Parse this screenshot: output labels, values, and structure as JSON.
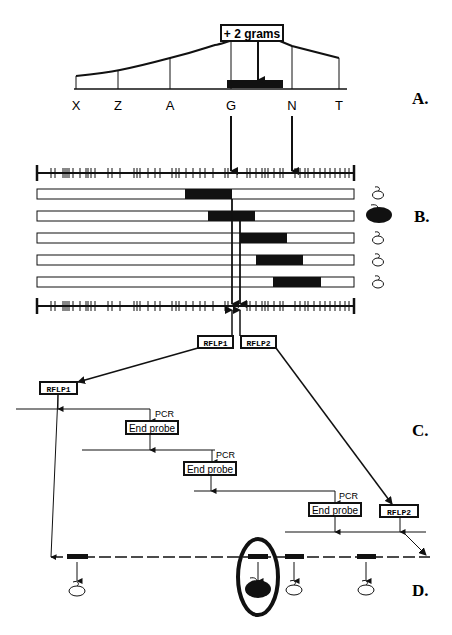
{
  "panels": {
    "a": {
      "label": "A."
    },
    "b": {
      "label": "B."
    },
    "c": {
      "label": "C."
    },
    "d": {
      "label": "D."
    }
  },
  "qtl": {
    "effect_label": "+ 2 grams",
    "markers": [
      "X",
      "Z",
      "A",
      "G",
      "N",
      "T"
    ]
  },
  "rflp": {
    "rflp1": "RFLP1",
    "rflp2": "RFLP2"
  },
  "walk": {
    "pcr_label": "PCR",
    "end_probe_label": "End probe"
  },
  "colors": {
    "ink": "#111111",
    "background": "#ffffff"
  }
}
